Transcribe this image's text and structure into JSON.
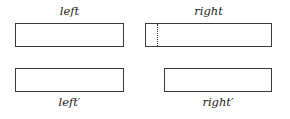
{
  "figure": {
    "background_color": "#ffffff",
    "stroke_color": "#3a3a3a",
    "text_color": "#1a1a1a",
    "dotted_color": "#2b2b2b"
  },
  "labels": {
    "top_left": "left",
    "top_right": "right",
    "bottom_left": "left′",
    "bottom_right": "right′"
  },
  "boxes": {
    "top_left": {
      "x": 15,
      "y": 23,
      "width": 109,
      "height": 24
    },
    "top_right": {
      "x": 145,
      "y": 23,
      "width": 127,
      "height": 24
    },
    "bottom_left": {
      "x": 15,
      "y": 68,
      "width": 109,
      "height": 24
    },
    "bottom_right": {
      "x": 164,
      "y": 68,
      "width": 108,
      "height": 24
    }
  },
  "divider": {
    "name": "dotted-split-marker",
    "x": 157,
    "y": 24,
    "height": 22,
    "style": "dotted"
  }
}
